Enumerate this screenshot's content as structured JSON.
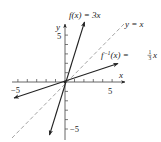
{
  "figure": {
    "type": "function-inverse-graph",
    "axes": {
      "x_label": "x",
      "y_label": "y",
      "x_ticks": {
        "min": -6,
        "max": 6,
        "step": 1
      },
      "y_ticks": {
        "min": -6,
        "max": 6,
        "step": 1
      },
      "x_tick_labels": [
        {
          "value": -5,
          "text": "−5"
        },
        {
          "value": 5,
          "text": "5"
        }
      ],
      "y_tick_labels": [
        {
          "value": 5,
          "text": "5"
        },
        {
          "value": -5,
          "text": "−5"
        }
      ]
    },
    "curves": [
      {
        "name": "f",
        "equation": "f(x) = 3x",
        "label_main": "f(x) = 3x",
        "style": "solid",
        "color": "#222222"
      },
      {
        "name": "f_inverse",
        "equation": "f^-1(x) = (1/3)x",
        "label_prefix": "f",
        "label_sup": "−1",
        "label_mid": "(x) = ",
        "label_frac_num": "1",
        "label_frac_den": "3",
        "label_suffix": "x",
        "style": "solid",
        "color": "#222222"
      },
      {
        "name": "identity",
        "equation": "y = x",
        "label_main": "y = x",
        "style": "dashed",
        "color": "#999999"
      }
    ]
  }
}
